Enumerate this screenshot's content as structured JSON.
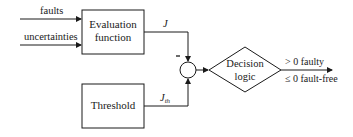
{
  "inputs": {
    "faults": "faults",
    "uncertainties": "uncertainties"
  },
  "blocks": {
    "evaluation": {
      "line1": "Evaluation",
      "line2": "function"
    },
    "threshold": {
      "label": "Threshold"
    },
    "decision": {
      "line1": "Decision",
      "line2": "logic"
    }
  },
  "signals": {
    "J": "J",
    "Jth_main": "J",
    "Jth_sub": "th",
    "minus": "−"
  },
  "outputs": {
    "faulty": "> 0 faulty",
    "fault_free": "≤ 0 fault-free"
  },
  "colors": {
    "stroke": "#1a1a1a",
    "background": "#ffffff"
  }
}
